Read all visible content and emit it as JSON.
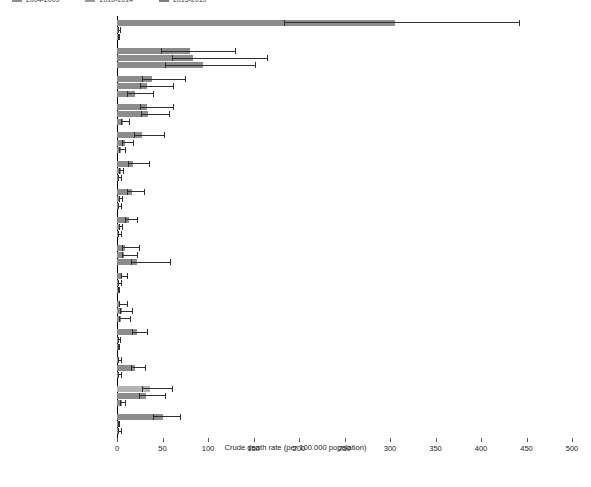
{
  "legend": {
    "items": [
      {
        "label": "2004-2009",
        "color": "#8c8c8c"
      },
      {
        "label": "2010-2014",
        "color": "#9a9a9a"
      },
      {
        "label": "2015-2019",
        "color": "#7d7d7d"
      }
    ]
  },
  "colors": {
    "series_default": "#8c8c8c",
    "series_light": "#b3b3b3",
    "error_bar": "#2e2e2e",
    "axis": "#000000",
    "text": "#1a1a1a"
  },
  "chart_data": {
    "type": "bar",
    "orientation": "horizontal",
    "title": "",
    "xlabel": "Crude death rate (per 100 000 population)",
    "ylabel": "",
    "xlim": [
      0,
      500
    ],
    "xticks": [
      0,
      50,
      100,
      150,
      200,
      250,
      300,
      350,
      400,
      450,
      500
    ],
    "grid": false,
    "legend_position": "top-left",
    "categories": [
      "Syrian Arab Republic",
      "Iraq",
      "Afghanistan",
      "Somalia",
      "Central African Republic",
      "South Sudan",
      "Libya",
      "Yemen",
      "Sudan",
      "Ukraine",
      "Chad",
      "Burundi",
      "Nepal",
      "Sri Lanka",
      "Liberia"
    ],
    "series": [
      {
        "name": "2004-2009",
        "values": [
          305,
          80,
          38,
          33,
          27,
          18,
          17,
          13,
          9,
          6,
          3,
          22,
          2,
          36,
          50
        ],
        "ci_low": [
          183,
          48,
          28,
          25,
          19,
          12,
          11,
          9,
          6,
          4,
          2,
          17,
          1,
          28,
          40
        ],
        "ci_high": [
          442,
          130,
          75,
          62,
          52,
          35,
          30,
          22,
          24,
          11,
          11,
          33,
          4,
          60,
          69
        ]
      },
      {
        "name": "2010-2014",
        "values": [
          2,
          83,
          33,
          34,
          9,
          4,
          3,
          3,
          8,
          2,
          5,
          2,
          20,
          32,
          1
        ],
        "ci_low": [
          1,
          60,
          25,
          26,
          6,
          2,
          2,
          2,
          5,
          1,
          3,
          1,
          15,
          24,
          1
        ],
        "ci_high": [
          3,
          165,
          62,
          57,
          18,
          7,
          5,
          5,
          22,
          4,
          17,
          3,
          31,
          53,
          2
        ]
      },
      {
        "name": "2015-2019",
        "values": [
          1,
          95,
          20,
          7,
          4,
          2,
          2,
          2,
          22,
          1,
          4,
          1,
          2,
          5,
          2
        ],
        "ci_low": [
          1,
          53,
          11,
          4,
          2,
          1,
          1,
          1,
          15,
          1,
          2,
          1,
          1,
          3,
          1
        ],
        "ci_high": [
          2,
          152,
          40,
          13,
          9,
          4,
          4,
          4,
          58,
          2,
          14,
          2,
          4,
          9,
          4
        ]
      }
    ]
  }
}
